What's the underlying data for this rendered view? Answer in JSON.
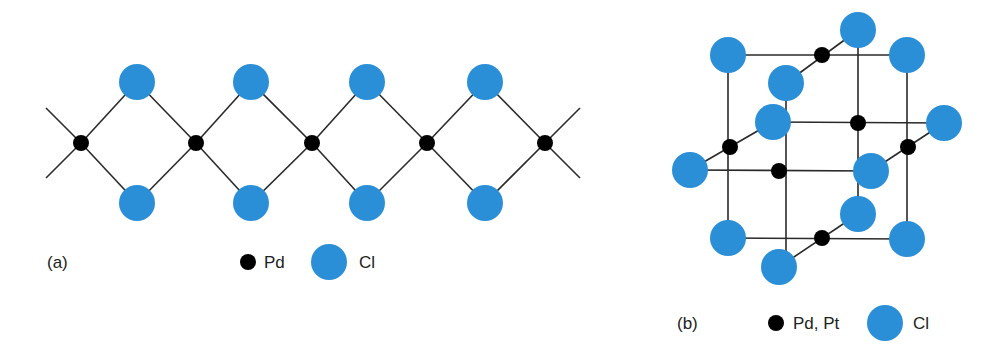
{
  "colors": {
    "cl": "#2b8fd8",
    "metal": "#000000",
    "bond": "#2a2a2a"
  },
  "panel_a": {
    "label": "(a)",
    "legend": {
      "metal_label": "Pd",
      "chloride_label": "Cl"
    },
    "metal_nodes": [
      [
        81,
        143
      ],
      [
        196,
        143
      ],
      [
        312,
        143
      ],
      [
        427,
        143
      ],
      [
        545,
        143
      ]
    ],
    "cl_nodes": [
      [
        137,
        82
      ],
      [
        251,
        82
      ],
      [
        367,
        82
      ],
      [
        485,
        82
      ],
      [
        137,
        203
      ],
      [
        251,
        203
      ],
      [
        367,
        203
      ],
      [
        485,
        203
      ]
    ],
    "end_bonds": [
      [
        [
          46,
          108
        ],
        [
          81,
          143
        ]
      ],
      [
        [
          46,
          178
        ],
        [
          81,
          143
        ]
      ],
      [
        [
          545,
          143
        ],
        [
          580,
          108
        ]
      ],
      [
        [
          545,
          143
        ],
        [
          580,
          178
        ]
      ]
    ]
  },
  "panel_b": {
    "label": "(b)",
    "legend": {
      "metal_label": "Pd, Pt",
      "chloride_label": "Cl"
    },
    "metal_nodes": [
      [
        822,
        55
      ],
      [
        858,
        123
      ],
      [
        908,
        147
      ],
      [
        730,
        147
      ],
      [
        779,
        171
      ],
      [
        822,
        238
      ]
    ],
    "cl_nodes": [
      [
        858,
        30
      ],
      [
        728,
        55
      ],
      [
        907,
        55
      ],
      [
        786,
        83
      ],
      [
        773,
        122
      ],
      [
        944,
        123
      ],
      [
        690,
        170
      ],
      [
        871,
        171
      ],
      [
        858,
        214
      ],
      [
        728,
        238
      ],
      [
        907,
        239
      ],
      [
        779,
        267
      ]
    ],
    "bonds": [
      [
        [
          728,
          55
        ],
        [
          907,
          55
        ]
      ],
      [
        [
          786,
          83
        ],
        [
          858,
          30
        ]
      ],
      [
        [
          728,
          55
        ],
        [
          728,
          238
        ]
      ],
      [
        [
          907,
          55
        ],
        [
          907,
          239
        ]
      ],
      [
        [
          858,
          30
        ],
        [
          858,
          214
        ]
      ],
      [
        [
          786,
          83
        ],
        [
          786,
          267
        ]
      ],
      [
        [
          773,
          122
        ],
        [
          944,
          123
        ]
      ],
      [
        [
          690,
          170
        ],
        [
          773,
          122
        ]
      ],
      [
        [
          871,
          171
        ],
        [
          944,
          123
        ]
      ],
      [
        [
          690,
          170
        ],
        [
          871,
          171
        ]
      ],
      [
        [
          728,
          238
        ],
        [
          907,
          239
        ]
      ],
      [
        [
          779,
          267
        ],
        [
          858,
          214
        ]
      ]
    ]
  }
}
